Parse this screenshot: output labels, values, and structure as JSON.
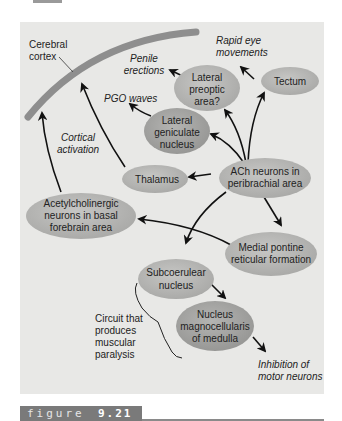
{
  "colors": {
    "panel_bg": "#e8e8e6",
    "node_fill": "#b9b9b7",
    "node_fill_dark": "#a3a3a1",
    "cortex_band": "#8e8e8e",
    "arrow": "#111111",
    "caption_bar": "#7a7a7a"
  },
  "labels": {
    "cerebral_cortex": [
      "Cerebral",
      "cortex"
    ],
    "penile_erections": [
      "Penile",
      "erections"
    ],
    "rapid_eye_movements": [
      "Rapid eye",
      "movements"
    ],
    "pgo_waves": [
      "PGO waves"
    ],
    "cortical_activation": [
      "Cortical",
      "activation"
    ],
    "circuit_paralysis": [
      "Circuit that",
      "produces",
      "muscular",
      "paralysis"
    ],
    "inhibition_motor": [
      "Inhibition of",
      "motor neurons"
    ]
  },
  "nodes": {
    "lateral_preoptic": [
      "Lateral",
      "preoptic",
      "area?"
    ],
    "tectum": [
      "Tectum"
    ],
    "lateral_geniculate": [
      "Lateral",
      "geniculate",
      "nucleus"
    ],
    "thalamus": [
      "Thalamus"
    ],
    "ach_peribrachial": [
      "ACh neurons in",
      "peribrachial area"
    ],
    "acetylcholinergic_basal": [
      "Acetylcholinergic",
      "neurons in basal",
      "forebrain area"
    ],
    "medial_pontine": [
      "Medial pontine",
      "reticular formation"
    ],
    "subcoerulear": [
      "Subcoerulear",
      "nucleus"
    ],
    "magnocellularis": [
      "Nucleus",
      "magnocellularis",
      "of medulla"
    ]
  },
  "caption": {
    "word": "figure",
    "number": "9.21"
  }
}
